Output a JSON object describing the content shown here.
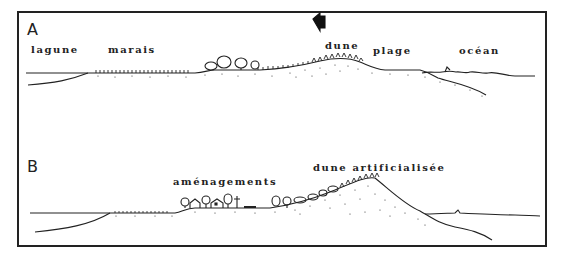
{
  "figure": {
    "panels": [
      {
        "letter": "A",
        "labels": {
          "lagune": "lagune",
          "marais": "marais",
          "dune": "dune",
          "plage": "plage",
          "ocean": "océan"
        },
        "arrow": "wind-arrow-left"
      },
      {
        "letter": "B",
        "labels": {
          "amenagements": "aménagements",
          "dune_artificialisee": "dune artificialisée"
        }
      }
    ],
    "colors": {
      "ink": "#222222",
      "background": "#ffffff"
    }
  }
}
